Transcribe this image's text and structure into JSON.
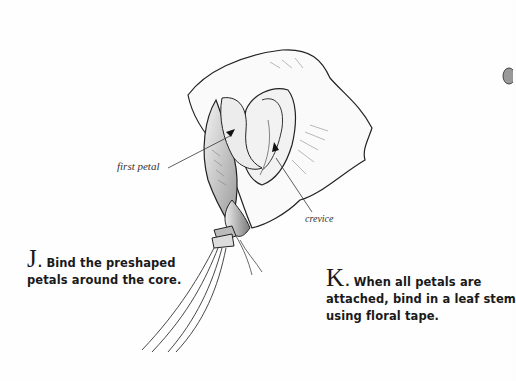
{
  "steps": [
    {
      "letter": "J",
      "text": ". Bind the preshaped petals around the core."
    },
    {
      "letter": "K",
      "text": ". When all petals are attached, bind in a leaf stem using floral tape."
    }
  ],
  "labels": {
    "first_petal": "first petal",
    "crevice": "crevice"
  },
  "illustration": {
    "subject": "rose-bud-assembly",
    "ink_color": "#222222",
    "shade_color": "#888888"
  }
}
